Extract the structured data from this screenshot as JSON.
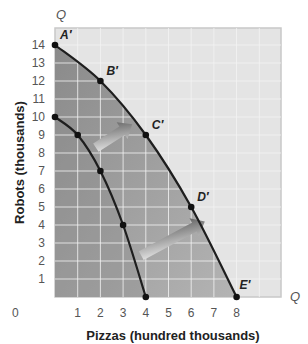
{
  "chart_data": {
    "type": "line",
    "title": "",
    "xlabel": "Pizzas (hundred thousands)",
    "ylabel": "Robots (thousands)",
    "x_axis_symbol": "Q",
    "y_axis_symbol": "Q",
    "origin_label": "0",
    "xlim": [
      0,
      10
    ],
    "ylim": [
      0,
      15
    ],
    "x_ticks": [
      "1",
      "2",
      "3",
      "4",
      "5",
      "6",
      "7",
      "8"
    ],
    "y_ticks": [
      "1",
      "2",
      "3",
      "4",
      "5",
      "6",
      "7",
      "8",
      "9",
      "10",
      "11",
      "12",
      "13",
      "14"
    ],
    "grid": true,
    "series": [
      {
        "name": "Original PPF",
        "points": [
          [
            0,
            10
          ],
          [
            1,
            9
          ],
          [
            2,
            7
          ],
          [
            3,
            4
          ],
          [
            4,
            0
          ]
        ],
        "labels": [
          "",
          "",
          "",
          "",
          ""
        ]
      },
      {
        "name": "Shifted PPF",
        "points": [
          [
            0,
            14
          ],
          [
            2,
            12
          ],
          [
            4,
            9
          ],
          [
            6,
            5
          ],
          [
            8,
            0
          ]
        ],
        "labels": [
          "A′",
          "B′",
          "C′",
          "D′",
          "E′"
        ]
      }
    ],
    "annotations": [
      {
        "type": "arrow",
        "description": "outward shift arrow (upper)",
        "from": [
          1.8,
          8.3
        ],
        "to": [
          3.4,
          9.6
        ]
      },
      {
        "type": "arrow",
        "description": "outward shift arrow (lower)",
        "from": [
          3.8,
          2.3
        ],
        "to": [
          6.6,
          4.2
        ]
      }
    ]
  },
  "colors": {
    "background_plot": "#e4e4e4",
    "shaded_region": "#9a9a9a",
    "curve": "#1e1e1e",
    "grid": "#f4f4f4"
  }
}
